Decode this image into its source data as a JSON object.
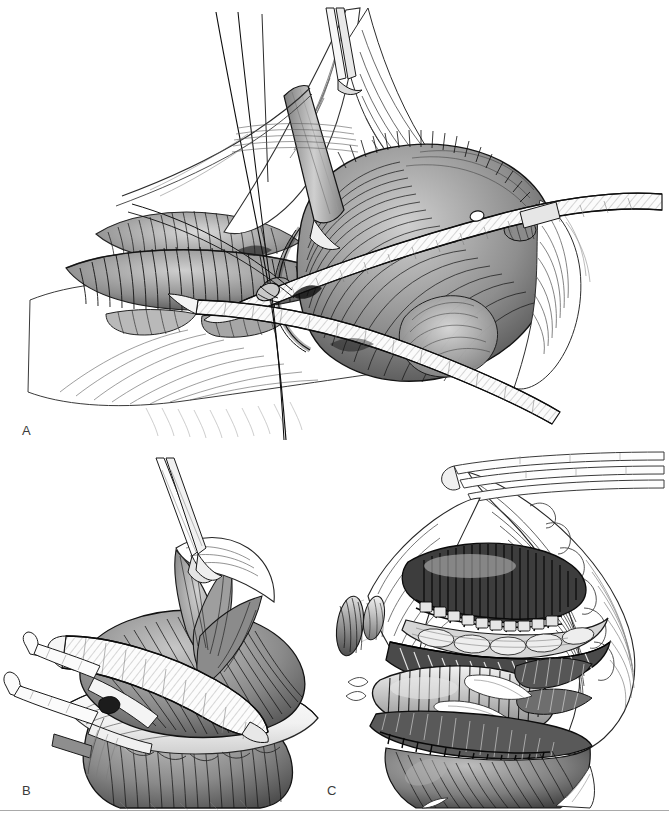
{
  "figure": {
    "kind": "surgical-illustration",
    "medium": "pen-and-ink line drawing with stipple and cross-hatch shading",
    "background_color": "#ffffff",
    "ink_color": "#1a1a1a",
    "width": 669,
    "height": 819,
    "panel_count": 3
  },
  "panels": [
    {
      "id": "A",
      "label": "A",
      "label_position": {
        "x": 22,
        "y": 424
      },
      "bounds": {
        "x": 0,
        "y": 0,
        "width": 669,
        "height": 450
      },
      "description": "Wide exposure of a deep surgical field. Two flat ribbon retractors sweep diagonally across a large rounded muscular mass at right; fine suture strands run from upper left down through the centre; layered striated muscle bellies and vessels fill the left half; fascial edges are reflected at the top.",
      "elements": [
        "flat-ribbon-retractor-upper",
        "flat-ribbon-retractor-lower",
        "narrow-retractor-blade-vertical",
        "suture-strands",
        "large-rounded-muscle-mass",
        "layered-striated-muscle-bellies",
        "reflected-fascial-flap",
        "retracted-skin-edge"
      ]
    },
    {
      "id": "B",
      "label": "B",
      "label_position": {
        "x": 22,
        "y": 784
      },
      "bounds": {
        "x": 0,
        "y": 450,
        "width": 330,
        "height": 360
      },
      "description": "Close three-quarter view of a flexed joint. A curved ribbon retractor passes horizontally beneath the elevated soft-tissue mass, a slender двух-pronged hook retractor enters from the left, and a fine forceps tip descends from above into the fanned fibre bundles.",
      "elements": [
        "curved-ribbon-retractor",
        "two-pronged-hook-retractor",
        "fine-forceps-tip",
        "fanned-fibre-bundles",
        "elevated-soft-tissue-mass",
        "pale-capsular-fold",
        "distal-muscle-belly"
      ]
    },
    {
      "id": "C",
      "label": "C",
      "label_position": {
        "x": 327,
        "y": 784
      },
      "bounds": {
        "x": 320,
        "y": 450,
        "width": 349,
        "height": 360
      },
      "description": "Deep wound cavity seen end-on. Slender instrument shafts enter from the upper right; inside the cavity several stacked tubular and striated structures are exposed, two of them closed with rows of interrupted sutures; tented fascia and skin form the surrounding triangular opening.",
      "elements": [
        "instrument-shafts",
        "tented-fascial-wall",
        "sutured-structure-upper",
        "sutured-structure-lower",
        "stacked-tubular-structures",
        "striated-muscle-layer",
        "deep-cavity-floor",
        "skin-edge"
      ]
    }
  ],
  "footer": {
    "rule_color": "#a9a9a9",
    "rule_y": 810
  }
}
